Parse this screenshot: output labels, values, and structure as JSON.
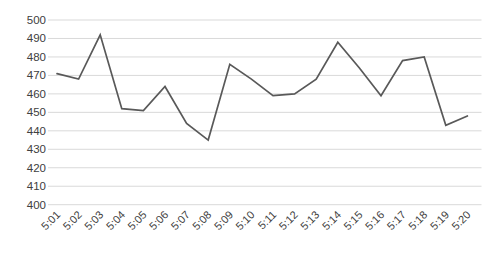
{
  "chart_data": {
    "type": "line",
    "title": "",
    "xlabel": "",
    "ylabel": "",
    "categories": [
      "5:01",
      "5:02",
      "5:03",
      "5:04",
      "5:05",
      "5:06",
      "5:07",
      "5:08",
      "5:09",
      "5:10",
      "5:11",
      "5:12",
      "5:13",
      "5:14",
      "5:15",
      "5:16",
      "5:17",
      "5:18",
      "5:19",
      "5:20"
    ],
    "values": [
      471,
      468,
      492,
      452,
      451,
      464,
      444,
      435,
      476,
      468,
      459,
      460,
      468,
      488,
      474,
      459,
      478,
      480,
      443,
      448
    ],
    "ylim": [
      400,
      500
    ],
    "ytick_step": 10,
    "ytick_labels": [
      "400",
      "410",
      "420",
      "430",
      "440",
      "450",
      "460",
      "470",
      "480",
      "490",
      "500"
    ],
    "grid": true,
    "legend": false,
    "x_label_rotation_deg": 45,
    "colors": {
      "series_line": "#595959",
      "gridline": "#d9d9d9",
      "tick_label": "#404040",
      "background": "#ffffff"
    }
  }
}
